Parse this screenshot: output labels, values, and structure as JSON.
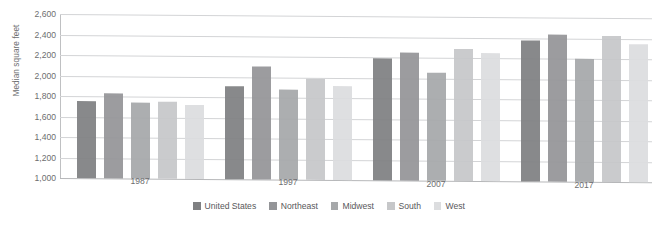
{
  "chart_data": {
    "type": "bar",
    "title": "",
    "xlabel": "",
    "ylabel": "Median square feet",
    "categories": [
      "1987",
      "1997",
      "2007",
      "2017"
    ],
    "ylim": [
      1000,
      2600
    ],
    "ytick_step": 200,
    "yticks": [
      "2,600",
      "2,400",
      "2,200",
      "2,000",
      "1,800",
      "1,600",
      "1,400",
      "1,200",
      "1,000"
    ],
    "ytick_values": [
      2600,
      2400,
      2200,
      2000,
      1800,
      1600,
      1400,
      1200,
      1000
    ],
    "grid": true,
    "legend_position": "bottom",
    "series": [
      {
        "name": "United States",
        "color": "#7f8082",
        "values": [
          1755,
          1910,
          2195,
          2375
        ]
      },
      {
        "name": "Northeast",
        "color": "#949598",
        "values": [
          1825,
          2100,
          2245,
          2430
        ]
      },
      {
        "name": "Midwest",
        "color": "#a6a8aa",
        "values": [
          1740,
          1875,
          2050,
          2200
        ]
      },
      {
        "name": "South",
        "color": "#c6c7c9",
        "values": [
          1755,
          1985,
          2285,
          2420
        ]
      },
      {
        "name": "West",
        "color": "#dcdddf",
        "values": [
          1720,
          1920,
          2245,
          2350
        ]
      }
    ]
  },
  "colors": {
    "gridline": "#d3d4d6",
    "axis": "#bfc0c2",
    "text": "#6d6e70",
    "background": "#ffffff"
  }
}
